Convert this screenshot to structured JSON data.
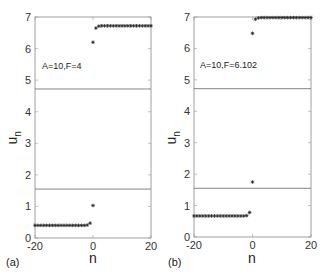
{
  "chart_data": [
    {
      "type": "scatter",
      "panel_label": "(a)",
      "annotation": "A=10,F=4",
      "xlabel": "n",
      "ylabel": "u_n",
      "xlim": [
        -20,
        20
      ],
      "ylim": [
        0,
        7
      ],
      "xticks": [
        -20,
        0,
        20
      ],
      "yticks": [
        0,
        1,
        2,
        3,
        4,
        5,
        6,
        7
      ],
      "hlines": [
        4.72,
        1.55
      ],
      "marker": "*",
      "series": [
        {
          "name": "lower branch",
          "x": [
            -20,
            -19,
            -18,
            -17,
            -16,
            -15,
            -14,
            -13,
            -12,
            -11,
            -10,
            -9,
            -8,
            -7,
            -6,
            -5,
            -4,
            -3,
            -2,
            -1,
            0
          ],
          "values": [
            0.4,
            0.4,
            0.4,
            0.4,
            0.4,
            0.4,
            0.4,
            0.4,
            0.4,
            0.4,
            0.4,
            0.4,
            0.4,
            0.4,
            0.4,
            0.4,
            0.4,
            0.4,
            0.41,
            0.47,
            1.03
          ]
        },
        {
          "name": "upper branch",
          "x": [
            0,
            1,
            2,
            3,
            4,
            5,
            6,
            7,
            8,
            9,
            10,
            11,
            12,
            13,
            14,
            15,
            16,
            17,
            18,
            19,
            20
          ],
          "values": [
            6.2,
            6.65,
            6.71,
            6.72,
            6.72,
            6.72,
            6.72,
            6.72,
            6.72,
            6.72,
            6.72,
            6.72,
            6.72,
            6.72,
            6.72,
            6.72,
            6.72,
            6.72,
            6.72,
            6.72,
            6.72
          ]
        }
      ]
    },
    {
      "type": "scatter",
      "panel_label": "(b)",
      "annotation": "A=10,F=6.102",
      "xlabel": "n",
      "ylabel": "u_n",
      "xlim": [
        -20,
        20
      ],
      "ylim": [
        0,
        7
      ],
      "xticks": [
        -20,
        0,
        20
      ],
      "yticks": [
        0,
        1,
        2,
        3,
        4,
        5,
        6,
        7
      ],
      "hlines": [
        4.72,
        1.55
      ],
      "marker": "*",
      "series": [
        {
          "name": "lower branch",
          "x": [
            -20,
            -19,
            -18,
            -17,
            -16,
            -15,
            -14,
            -13,
            -12,
            -11,
            -10,
            -9,
            -8,
            -7,
            -6,
            -5,
            -4,
            -3,
            -2,
            -1,
            0
          ],
          "values": [
            0.67,
            0.67,
            0.67,
            0.67,
            0.67,
            0.67,
            0.67,
            0.67,
            0.67,
            0.67,
            0.67,
            0.67,
            0.67,
            0.67,
            0.67,
            0.67,
            0.67,
            0.67,
            0.68,
            0.78,
            1.75
          ]
        },
        {
          "name": "upper branch",
          "x": [
            0,
            1,
            2,
            3,
            4,
            5,
            6,
            7,
            8,
            9,
            10,
            11,
            12,
            13,
            14,
            15,
            16,
            17,
            18,
            19,
            20
          ],
          "values": [
            6.48,
            6.93,
            6.97,
            6.98,
            6.98,
            6.98,
            6.98,
            6.98,
            6.98,
            6.98,
            6.98,
            6.98,
            6.98,
            6.98,
            6.98,
            6.98,
            6.98,
            6.98,
            6.98,
            6.98,
            6.98
          ]
        }
      ]
    }
  ],
  "panels": [
    {
      "label": "(a)",
      "annotation": "A=10,F=4",
      "xlabel": "n",
      "ylabel_main": "u",
      "ylabel_sub": "n"
    },
    {
      "label": "(b)",
      "annotation": "A=10,F=6.102",
      "xlabel": "n",
      "ylabel_main": "u",
      "ylabel_sub": "n"
    }
  ]
}
